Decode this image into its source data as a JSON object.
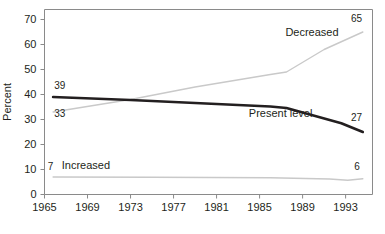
{
  "chart_data": {
    "type": "line",
    "title": "",
    "subtitle": "",
    "xlabel": "",
    "ylabel": "Percent",
    "xlim": [
      1965,
      1995.5
    ],
    "ylim": [
      0,
      74
    ],
    "grid": false,
    "legend": "inline-labels",
    "x_ticks": [
      1965,
      1969,
      1973,
      1977,
      1981,
      1985,
      1989,
      1993
    ],
    "x_tick_labels": [
      "1965",
      "1969",
      "1973",
      "1977",
      "1981",
      "1985",
      "1989",
      "1993"
    ],
    "y_ticks": [
      0,
      10,
      20,
      30,
      40,
      50,
      60,
      70
    ],
    "y_tick_labels": [
      "0",
      "10",
      "20",
      "30",
      "40",
      "50",
      "60",
      "70"
    ],
    "series": [
      {
        "name": "Decreased",
        "color": "#c9c9c9",
        "width": 1.4,
        "label_x": 1987.4,
        "label_y": 63.5,
        "start_label": "33",
        "end_label": "65",
        "x": [
          1965.8,
          1973.0,
          1979.0,
          1986.0,
          1987.5,
          1991.0,
          1994.6
        ],
        "y": [
          33,
          38,
          43,
          48,
          49,
          58,
          65
        ]
      },
      {
        "name": "Present level",
        "color": "#231f20",
        "width": 2.6,
        "label_x": 1984.0,
        "label_y": 31.0,
        "start_label": "39",
        "end_label": "27",
        "x": [
          1965.8,
          1973.0,
          1979.0,
          1986.0,
          1987.5,
          1992.6,
          1994.6
        ],
        "y": [
          39,
          37.8,
          36.6,
          35.2,
          34.6,
          28.5,
          25
        ]
      },
      {
        "name": "Increased",
        "color": "#c9c9c9",
        "width": 1.4,
        "label_x": 1966.6,
        "label_y": 10.2,
        "start_label": "7",
        "end_label": "6",
        "x": [
          1965.8,
          1975.0,
          1986.0,
          1991.5,
          1993.2,
          1994.6
        ],
        "y": [
          7,
          6.9,
          6.7,
          6.2,
          5.7,
          6.3
        ]
      }
    ],
    "annotations": [
      {
        "name": "decreased-start-value",
        "text": "33",
        "x": 1965.9,
        "y": 31.0
      },
      {
        "name": "decreased-end-value",
        "text": "65",
        "x": 1993.5,
        "y": 69.0
      },
      {
        "name": "present-start-value",
        "text": "39",
        "x": 1965.9,
        "y": 42.2
      },
      {
        "name": "present-end-value",
        "text": "27",
        "x": 1993.5,
        "y": 29.3
      },
      {
        "name": "increased-start-value",
        "text": "7",
        "x": 1965.3,
        "y": 10.0
      },
      {
        "name": "increased-end-value",
        "text": "6",
        "x": 1993.8,
        "y": 10.0
      }
    ]
  },
  "axes": {
    "y_axis_title": "Percent"
  }
}
